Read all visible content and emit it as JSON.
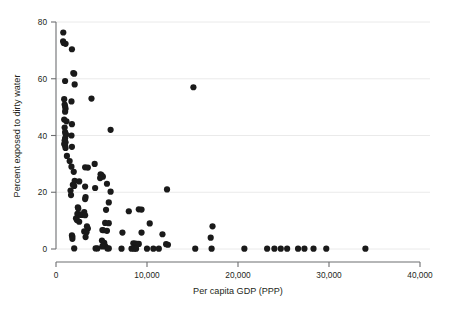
{
  "chart_data": {
    "type": "scatter",
    "title": "",
    "subtitle": "",
    "xlabel": "Per capita GDP (PPP)",
    "ylabel": "Percent exposed to dirty water",
    "xlim": [
      0,
      40000
    ],
    "ylim": [
      0,
      80
    ],
    "xticks": [
      0,
      10000,
      20000,
      30000,
      40000
    ],
    "xticklabels": [
      "0",
      "10,000",
      "20,000",
      "30,000",
      "40,000"
    ],
    "yticks": [
      0,
      20,
      40,
      60,
      80
    ],
    "yticklabels": [
      "0",
      "20",
      "40",
      "60",
      "80"
    ],
    "grid": "horizontal",
    "legend": "none",
    "marker": {
      "shape": "circle",
      "color": "#1a1a1a",
      "size_px": 3.1
    },
    "colors": {
      "marker": "#1a1a1a",
      "axis": "#6d6e71",
      "grid": "#e8e8e8",
      "text": "#231f20",
      "background": "#ffffff"
    },
    "n_points": 148,
    "points": [
      [
        800,
        76.3
      ],
      [
        780,
        73.2
      ],
      [
        850,
        72.6
      ],
      [
        1050,
        72.3
      ],
      [
        1750,
        70.4
      ],
      [
        1900,
        62.0
      ],
      [
        2000,
        61.8
      ],
      [
        1000,
        59.2
      ],
      [
        2050,
        58.0
      ],
      [
        15100,
        57.0
      ],
      [
        3900,
        53.0
      ],
      [
        900,
        52.8
      ],
      [
        1700,
        52.0
      ],
      [
        950,
        50.9
      ],
      [
        1000,
        50.2
      ],
      [
        1050,
        49.4
      ],
      [
        1000,
        48.4
      ],
      [
        900,
        45.6
      ],
      [
        1150,
        45.0
      ],
      [
        1750,
        44.0
      ],
      [
        950,
        42.8
      ],
      [
        6000,
        42.0
      ],
      [
        1000,
        41.2
      ],
      [
        1050,
        40.6
      ],
      [
        1100,
        40.2
      ],
      [
        1700,
        40.0
      ],
      [
        1000,
        39.0
      ],
      [
        950,
        38.2
      ],
      [
        1050,
        37.6
      ],
      [
        900,
        37.0
      ],
      [
        1000,
        36.4
      ],
      [
        1750,
        36.0
      ],
      [
        1050,
        35.6
      ],
      [
        1200,
        32.8
      ],
      [
        1500,
        31.0
      ],
      [
        4250,
        30.0
      ],
      [
        1700,
        29.0
      ],
      [
        3200,
        28.8
      ],
      [
        3500,
        28.7
      ],
      [
        1950,
        27.2
      ],
      [
        4900,
        26.3
      ],
      [
        5000,
        26.0
      ],
      [
        5150,
        25.5
      ],
      [
        4850,
        25.0
      ],
      [
        2050,
        24.0
      ],
      [
        2550,
        23.8
      ],
      [
        5600,
        23.0
      ],
      [
        1850,
        22.6
      ],
      [
        2000,
        22.2
      ],
      [
        3200,
        22.0
      ],
      [
        4300,
        21.5
      ],
      [
        12200,
        21.0
      ],
      [
        1600,
        20.6
      ],
      [
        6000,
        20.2
      ],
      [
        1650,
        19.0
      ],
      [
        3250,
        18.3
      ],
      [
        3200,
        17.6
      ],
      [
        5800,
        16.4
      ],
      [
        2400,
        14.7
      ],
      [
        2450,
        14.3
      ],
      [
        9100,
        14.0
      ],
      [
        9400,
        13.9
      ],
      [
        5500,
        13.8
      ],
      [
        8000,
        13.3
      ],
      [
        3100,
        13.0
      ],
      [
        2350,
        12.4
      ],
      [
        2500,
        12.2
      ],
      [
        2700,
        12.1
      ],
      [
        2800,
        12.0
      ],
      [
        3200,
        11.9
      ],
      [
        2200,
        10.8
      ],
      [
        2300,
        10.2
      ],
      [
        2550,
        9.6
      ],
      [
        5400,
        9.2
      ],
      [
        5800,
        9.1
      ],
      [
        10300,
        9.0
      ],
      [
        3400,
        8.0
      ],
      [
        17200,
        8.0
      ],
      [
        3500,
        7.2
      ],
      [
        5100,
        6.7
      ],
      [
        5200,
        6.6
      ],
      [
        5600,
        6.4
      ],
      [
        3100,
        6.2
      ],
      [
        3300,
        6.0
      ],
      [
        3350,
        5.9
      ],
      [
        7300,
        5.8
      ],
      [
        9400,
        5.8
      ],
      [
        11700,
        5.2
      ],
      [
        1750,
        4.8
      ],
      [
        1800,
        4.4
      ],
      [
        3250,
        4.2
      ],
      [
        17000,
        4.0
      ],
      [
        1800,
        3.6
      ],
      [
        5050,
        3.0
      ],
      [
        5300,
        2.2
      ],
      [
        8500,
        2.0
      ],
      [
        8700,
        1.9
      ],
      [
        8900,
        1.8
      ],
      [
        9100,
        1.8
      ],
      [
        12100,
        1.7
      ],
      [
        12300,
        1.5
      ],
      [
        5200,
        1.2
      ],
      [
        5400,
        1.0
      ],
      [
        5100,
        0.9
      ],
      [
        2000,
        0.2
      ],
      [
        4350,
        0.2
      ],
      [
        4550,
        0.2
      ],
      [
        5650,
        0.2
      ],
      [
        5800,
        0.2
      ],
      [
        7200,
        0.1
      ],
      [
        8300,
        0.1
      ],
      [
        8600,
        0.1
      ],
      [
        8800,
        0.1
      ],
      [
        10000,
        0.1
      ],
      [
        10700,
        0.1
      ],
      [
        11300,
        0.1
      ],
      [
        15300,
        0.1
      ],
      [
        17100,
        0.1
      ],
      [
        20700,
        0.1
      ],
      [
        23200,
        0.1
      ],
      [
        24000,
        0.1
      ],
      [
        24700,
        0.1
      ],
      [
        25400,
        0.1
      ],
      [
        26600,
        0.1
      ],
      [
        27300,
        0.1
      ],
      [
        28300,
        0.1
      ],
      [
        29700,
        0.1
      ],
      [
        34000,
        0.1
      ]
    ]
  }
}
